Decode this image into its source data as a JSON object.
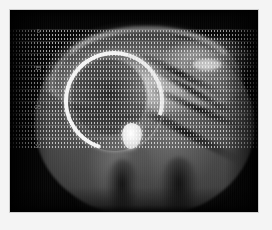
{
  "viewer": {
    "name": "medical-scan-viewer",
    "background_color": "#f2f2f2",
    "image_background_color": "#000000",
    "border_color": "#cfcfcf"
  },
  "scan": {
    "modality_appearance": "grayscale sagittal tomographic slice",
    "description": "Sagittal grayscale scan of head and neck soft tissue with a bright hyperintense crescent-shaped structure and a rounded bright nodule at its inferior tip",
    "alt_text": "Grayscale medical scan with dotted measurement grid overlay",
    "accent_color": "#ffffff"
  },
  "overlay": {
    "grid_name": "dotted-measurement-grid",
    "grid_dot_color": "#ebebeb",
    "grid_visible": true
  },
  "depth_scale": {
    "label": "",
    "ticks": [
      {
        "value": "5"
      },
      {
        "value": "15"
      },
      {
        "value": "25"
      },
      {
        "value": "30"
      }
    ]
  },
  "corner": {
    "mark": ""
  }
}
